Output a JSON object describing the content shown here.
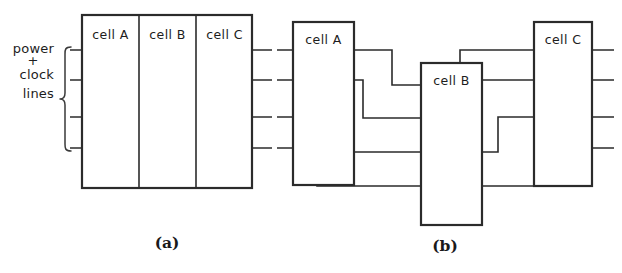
{
  "figure": {
    "caption_a": "(a)",
    "caption_b": "(b)",
    "annotation": {
      "line1": "power",
      "line2": "+",
      "line3": "clock",
      "line4": "lines"
    }
  },
  "panel_a": {
    "cells": [
      {
        "label": "cell A"
      },
      {
        "label": "cell B"
      },
      {
        "label": "cell C"
      }
    ]
  },
  "panel_b": {
    "cells": [
      {
        "label": "cell A"
      },
      {
        "label": "cell B"
      },
      {
        "label": "cell C"
      }
    ]
  },
  "colors": {
    "ink": "#2b2b2b",
    "background": "#ffffff"
  }
}
